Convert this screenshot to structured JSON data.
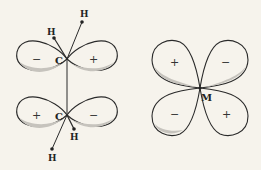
{
  "diagram": {
    "colors": {
      "background": "#f6f3ec",
      "stroke": "#2a2a2a",
      "shade": "#c9c6c0"
    },
    "left_structure": {
      "top_carbon": {
        "atom_label": "C",
        "left_lobe_sign": "−",
        "right_lobe_sign": "+",
        "hydrogens": [
          "H",
          "H"
        ]
      },
      "bottom_carbon": {
        "atom_label": "C",
        "left_lobe_sign": "+",
        "right_lobe_sign": "−",
        "hydrogens": [
          "H",
          "H"
        ]
      }
    },
    "right_structure": {
      "atom_label": "M",
      "lobe_signs": {
        "top_left": "+",
        "top_right": "−",
        "bottom_left": "−",
        "bottom_right": "+"
      }
    }
  }
}
